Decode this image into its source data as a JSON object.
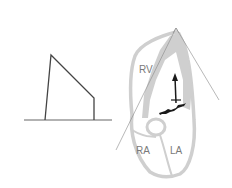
{
  "diagram": {
    "labels": {
      "rv": "RV",
      "ra": "RA",
      "la": "LA"
    },
    "colors": {
      "wall": "#cfcfcf",
      "line": "#444444",
      "jet": "#1a1a1a",
      "label": "#7a7a7a"
    }
  }
}
